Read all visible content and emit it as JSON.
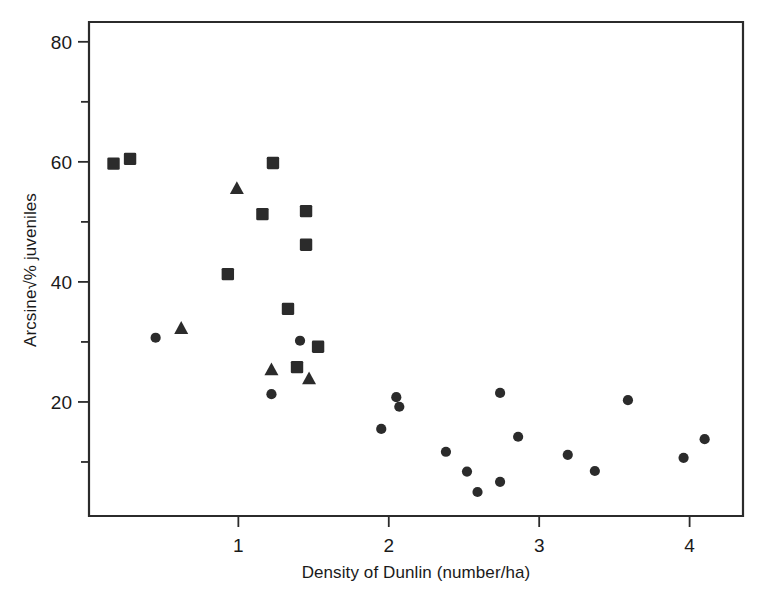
{
  "chart_data": {
    "type": "scatter",
    "title": "",
    "xlabel": "Density of Dunlin (number/ha)",
    "ylabel": "Arcsine√% juveniles",
    "xlim": [
      0.007,
      4.355
    ],
    "ylim": [
      1.0,
      83.3
    ],
    "grid": false,
    "legend": "none",
    "xticks": [
      1,
      2,
      3,
      4
    ],
    "xtick_labels": [
      "1",
      "2",
      "3",
      "4"
    ],
    "yticks": [
      10,
      20,
      30,
      40,
      50,
      60,
      70,
      80
    ],
    "ytick_labels": [
      "",
      "20",
      "",
      "40",
      "",
      "60",
      "",
      "80"
    ],
    "ytick_major": [
      20,
      40,
      60,
      80
    ],
    "ytick_minor": [
      10,
      30,
      50,
      70
    ],
    "series": [
      {
        "name": "squares",
        "marker": "square",
        "color": "#2b2b2b",
        "points": [
          [
            0.17,
            59.7
          ],
          [
            0.28,
            60.5
          ],
          [
            0.93,
            41.3
          ],
          [
            1.16,
            51.3
          ],
          [
            1.23,
            59.8
          ],
          [
            1.33,
            35.5
          ],
          [
            1.39,
            25.8
          ],
          [
            1.45,
            51.8
          ],
          [
            1.45,
            46.2
          ],
          [
            1.53,
            29.2
          ]
        ]
      },
      {
        "name": "triangles",
        "marker": "triangle",
        "color": "#2b2b2b",
        "points": [
          [
            0.62,
            32.2
          ],
          [
            0.99,
            55.5
          ],
          [
            1.22,
            25.3
          ],
          [
            1.47,
            23.8
          ]
        ]
      },
      {
        "name": "circles",
        "marker": "circle",
        "color": "#2b2b2b",
        "points": [
          [
            0.45,
            30.7
          ],
          [
            1.22,
            21.3
          ],
          [
            1.41,
            30.2
          ],
          [
            1.95,
            15.5
          ],
          [
            2.05,
            20.8
          ],
          [
            2.07,
            19.2
          ],
          [
            2.38,
            11.7
          ],
          [
            2.52,
            8.4
          ],
          [
            2.59,
            5.0
          ],
          [
            2.74,
            21.5
          ],
          [
            2.74,
            6.7
          ],
          [
            2.86,
            14.2
          ],
          [
            3.19,
            11.2
          ],
          [
            3.37,
            8.5
          ],
          [
            3.59,
            20.3
          ],
          [
            3.96,
            10.7
          ],
          [
            4.1,
            13.8
          ]
        ]
      }
    ]
  },
  "axes": {
    "x_axis_label": "Density of Dunlin (number/ha)",
    "y_axis_label": "Arcsine√% juveniles",
    "y_label_prefix": "Arcsine",
    "y_label_radical": "√",
    "y_label_suffix": "% juveniles"
  }
}
